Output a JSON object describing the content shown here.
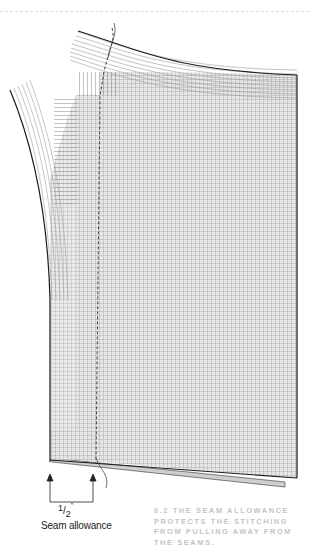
{
  "figure": {
    "fraction": {
      "numerator": "1",
      "slash": "/",
      "denominator": "2",
      "unit": "\""
    },
    "annotation_label": "Seam allowance",
    "caption": "6.2  The seam allowance protects the stitching from pulling away from the seams."
  },
  "colors": {
    "grid_line": "#8c8c8c",
    "outline": "#1a1a1a",
    "caption_text": "#c4c4c4"
  }
}
